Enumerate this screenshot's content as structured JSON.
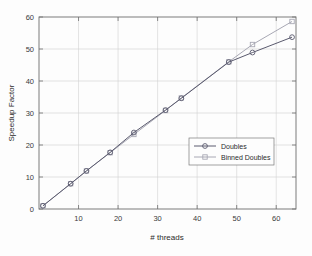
{
  "chart_data": {
    "type": "line",
    "title": "",
    "xlabel": "# threads",
    "ylabel": "Speedup Factor",
    "xlim": [
      0,
      65
    ],
    "ylim": [
      0,
      60
    ],
    "xticks": [
      10,
      20,
      30,
      40,
      50,
      60
    ],
    "yticks": [
      0,
      10,
      20,
      30,
      40,
      50,
      60
    ],
    "xtick_labels": [
      "10",
      "20",
      "30",
      "40",
      "50",
      "60"
    ],
    "ytick_labels": [
      "0",
      "10",
      "20",
      "30",
      "40",
      "50",
      "60"
    ],
    "grid": true,
    "legend_position": "center-right",
    "series": [
      {
        "name": "Doubles",
        "color": "#5a5a6e",
        "marker": "circle",
        "x": [
          1,
          8,
          12,
          18,
          24,
          32,
          36,
          48,
          54,
          64
        ],
        "values": [
          1.0,
          7.9,
          11.9,
          17.7,
          23.9,
          30.9,
          34.6,
          45.9,
          48.9,
          53.7
        ]
      },
      {
        "name": "Binned Doubles",
        "color": "#a8a8b4",
        "marker": "square",
        "x": [
          1,
          8,
          12,
          18,
          24,
          32,
          36,
          48,
          54,
          64
        ],
        "values": [
          1.0,
          7.9,
          11.9,
          17.6,
          23.3,
          30.8,
          34.7,
          46.0,
          51.4,
          58.6
        ]
      }
    ]
  },
  "axis": {
    "ylabel": "Speedup Factor",
    "xlabel": "# threads"
  },
  "legend": {
    "entries": [
      {
        "label": "Doubles"
      },
      {
        "label": "Binned Doubles"
      }
    ]
  }
}
